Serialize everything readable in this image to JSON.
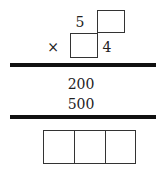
{
  "problem": {
    "multiplicand_digit": "5",
    "multiplier_digit": "4",
    "operator": "×",
    "partial_products": [
      "200",
      "500"
    ],
    "answer_boxes": [
      "",
      "",
      ""
    ]
  }
}
